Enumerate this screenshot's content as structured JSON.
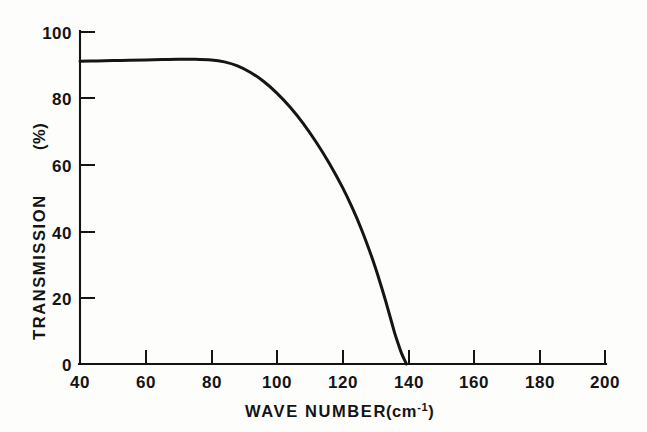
{
  "figure": {
    "background_color": "#fdfdfc",
    "ink_color": "#141414"
  },
  "chart_data": {
    "type": "line",
    "title": "",
    "subtitle": "",
    "xlabel": "WAVE NUMBER",
    "xlabel_units": "(cm",
    "xlabel_units_exponent": "-1",
    "xlabel_units_close": ")",
    "ylabel": "TRANSMISSION",
    "ylabel_units": "(%)",
    "xlim": [
      40,
      200
    ],
    "ylim": [
      0,
      100
    ],
    "grid": false,
    "legend": null,
    "x_ticks": [
      40,
      60,
      80,
      100,
      120,
      140,
      160,
      180,
      200
    ],
    "x_tick_labels": [
      "40",
      "60",
      "80",
      "100",
      "120",
      "140",
      "160",
      "180",
      "200"
    ],
    "y_ticks": [
      0,
      20,
      40,
      60,
      80,
      100
    ],
    "y_tick_labels": [
      "0",
      "20",
      "40",
      "60",
      "80",
      "100"
    ],
    "x_tick_direction": "in",
    "y_tick_direction": "in",
    "series": [
      {
        "name": "transmission",
        "color": "#151515",
        "line_width": 3,
        "x": [
          40,
          45,
          50,
          55,
          60,
          65,
          70,
          75,
          80,
          84,
          88,
          92,
          96,
          100,
          104,
          108,
          112,
          116,
          120,
          123,
          126,
          129,
          131,
          133,
          135,
          136,
          137,
          138,
          139,
          139.5
        ],
        "y": [
          91.2,
          91.3,
          91.4,
          91.5,
          91.6,
          91.7,
          91.8,
          91.8,
          91.6,
          91.0,
          89.8,
          87.8,
          85.1,
          81.6,
          77.4,
          72.5,
          66.8,
          60.4,
          53.2,
          47.0,
          40.0,
          32.0,
          26.0,
          19.5,
          12.5,
          9.0,
          6.0,
          3.2,
          1.0,
          0.0
        ]
      }
    ],
    "annotations": {
      "plateau_value": 91.6,
      "cutoff_wavenumber": 139
    }
  }
}
